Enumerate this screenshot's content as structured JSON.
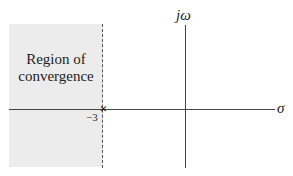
{
  "diagram": {
    "type": "s-plane pole-zero plot",
    "region": {
      "label_line1": "Region of",
      "label_line2": "convergence",
      "fill_color": "#ececec",
      "side": "left of boundary"
    },
    "boundary": {
      "style": "dashed",
      "sigma": -3
    },
    "pole": {
      "marker": "×",
      "label": "−3"
    },
    "axes": {
      "imag_label": "jω",
      "real_label": "σ"
    }
  }
}
